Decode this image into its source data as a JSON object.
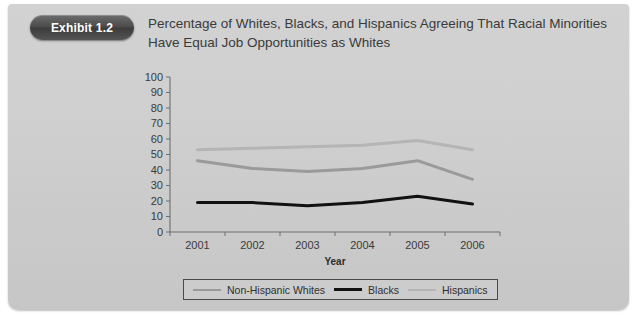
{
  "exhibit": {
    "badge_label": "Exhibit 1.2"
  },
  "title": {
    "line1": "Percentage of Whites, Blacks, and Hispanics Agreeing That Racial Minorities",
    "line2": "Have Equal Job Opportunities as Whites"
  },
  "colors": {
    "panel": "#cfcfcf",
    "badge": "#4a4a4a",
    "non_hispanic_whites": "#9a9a9a",
    "blacks": "#111111",
    "hispanics": "#b5b5b5",
    "axis": "#6e6e6e"
  },
  "chart_data": {
    "type": "line",
    "title": "Percentage of Whites, Blacks, and Hispanics Agreeing That Racial Minorities Have Equal Job Opportunities as Whites",
    "xlabel": "Year",
    "ylabel": "",
    "categories": [
      "2001",
      "2002",
      "2003",
      "2004",
      "2005",
      "2006"
    ],
    "x": [
      2001,
      2002,
      2003,
      2004,
      2005,
      2006
    ],
    "ylim": [
      0,
      100
    ],
    "yticks": [
      0,
      10,
      20,
      30,
      40,
      50,
      60,
      70,
      80,
      90,
      100
    ],
    "grid": false,
    "legend_position": "bottom",
    "series": [
      {
        "name": "Non-Hispanic Whites",
        "color": "#9a9a9a",
        "width": 3.0,
        "values": [
          46,
          41,
          39,
          41,
          46,
          34
        ]
      },
      {
        "name": "Blacks",
        "color": "#111111",
        "width": 3.0,
        "values": [
          19,
          19,
          17,
          19,
          23,
          18
        ]
      },
      {
        "name": "Hispanics",
        "color": "#b5b5b5",
        "width": 3.0,
        "values": [
          53,
          54,
          55,
          56,
          59,
          53
        ]
      }
    ]
  },
  "legend": {
    "items": [
      {
        "label": "Non-Hispanic Whites"
      },
      {
        "label": "Blacks"
      },
      {
        "label": "Hispanics"
      }
    ]
  }
}
